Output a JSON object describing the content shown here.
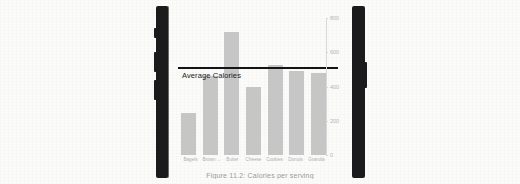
{
  "page": {
    "background_color": "#fbfbfa"
  },
  "device_frame": {
    "left_edge_name": "phone-left-edge",
    "right_edge_name": "phone-right-edge",
    "color": "#1b1b1d",
    "buttons": [
      "silent-switch",
      "volume-up",
      "volume-down",
      "power"
    ]
  },
  "figure": {
    "caption": "Figure 11.2: Calories per serving"
  },
  "chart_data": {
    "type": "bar",
    "title": "",
    "subtitle": "",
    "xlabel": "",
    "ylabel": "",
    "categories": [
      "Bagels",
      "Brown ...",
      "Butter",
      "Cheese",
      "Cookies",
      "Donuts",
      "Granola"
    ],
    "values": [
      245,
      460,
      720,
      395,
      525,
      490,
      480
    ],
    "bar_color": "#c6c6c6",
    "ylim": [
      0,
      800
    ],
    "yticks": [
      0,
      200,
      400,
      600,
      800
    ],
    "ytick_labels": [
      "0",
      "200",
      "400",
      "600",
      "800"
    ],
    "grid": false,
    "legend": "none",
    "annotations": [
      {
        "name": "average-calories-line",
        "label": "Average Calories",
        "value": 500,
        "color": "#141414",
        "style": "horizontal-reference-line"
      }
    ]
  }
}
